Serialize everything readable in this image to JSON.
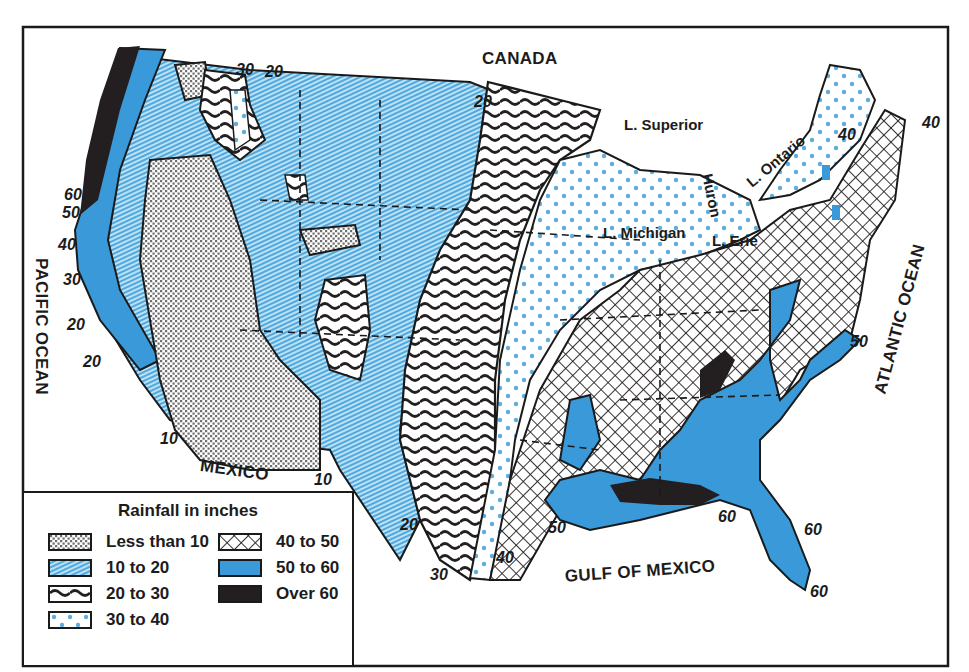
{
  "map": {
    "title": "Rainfall in inches",
    "colors": {
      "blue": "#3a9ad9",
      "light_blue": "#bfe3f6",
      "hatch_blue": "#5fb6e6",
      "dot_blue": "#5aaee0",
      "dark": "#231f20",
      "stipple": "#8c8c8c"
    },
    "labels": {
      "canada": "CANADA",
      "mexico": "MEXICO",
      "pacific_ocean": "PACIFIC OCEAN",
      "atlantic_ocean": "ATLANTIC OCEAN",
      "gulf_of_mexico": "GULF OF MEXICO"
    },
    "lakes": {
      "superior": "L. Superior",
      "michigan": "L. Michigan",
      "huron": "Huron",
      "erie": "L. Erie",
      "ontario": "L. Ontario"
    },
    "isohyets": [
      {
        "id": "nw-30",
        "text": "30"
      },
      {
        "id": "nw-20",
        "text": "20"
      },
      {
        "id": "north-20",
        "text": "20"
      },
      {
        "id": "west-60",
        "text": "60"
      },
      {
        "id": "west-50",
        "text": "50"
      },
      {
        "id": "west-40",
        "text": "40"
      },
      {
        "id": "west-30",
        "text": "30"
      },
      {
        "id": "west-20a",
        "text": "20"
      },
      {
        "id": "west-20b",
        "text": "20"
      },
      {
        "id": "sw-10a",
        "text": "10"
      },
      {
        "id": "sw-10b",
        "text": "10"
      },
      {
        "id": "tx-20",
        "text": "20"
      },
      {
        "id": "tx-30",
        "text": "30"
      },
      {
        "id": "tx-40",
        "text": "40"
      },
      {
        "id": "gulf-50",
        "text": "50"
      },
      {
        "id": "gulf-60",
        "text": "60"
      },
      {
        "id": "fl-60a",
        "text": "60"
      },
      {
        "id": "fl-60b",
        "text": "60"
      },
      {
        "id": "ne-40a",
        "text": "40"
      },
      {
        "id": "ne-40b",
        "text": "40"
      },
      {
        "id": "east-50",
        "text": "50"
      }
    ]
  },
  "legend": {
    "title": "Rainfall in inches",
    "items": [
      {
        "label": "Less than 10",
        "pattern": "stipple"
      },
      {
        "label": "10 to 20",
        "pattern": "hatch"
      },
      {
        "label": "20 to 30",
        "pattern": "wave"
      },
      {
        "label": "30 to 40",
        "pattern": "dots"
      },
      {
        "label": "40 to 50",
        "pattern": "crosshatch"
      },
      {
        "label": "50 to 60",
        "pattern": "solid-blue"
      },
      {
        "label": "Over 60",
        "pattern": "solid-dark"
      }
    ]
  }
}
